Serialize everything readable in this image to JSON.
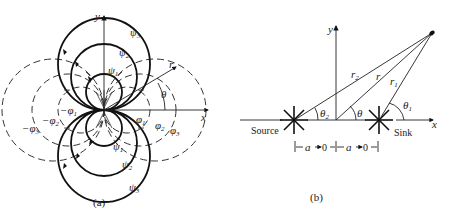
{
  "panel_a": {
    "caption": "(a)",
    "axis_x_label": "x",
    "axis_y_label": "y",
    "radial_label": "r",
    "angle_label": "θ",
    "streamlines": [
      {
        "symbol": "ψ",
        "index": "1"
      },
      {
        "symbol": "ψ",
        "index": "2"
      },
      {
        "symbol": "ψ",
        "index": "3"
      }
    ],
    "potential_lines_right": [
      {
        "symbol": "φ",
        "index": "1"
      },
      {
        "symbol": "φ",
        "index": "2"
      },
      {
        "symbol": "φ",
        "index": "3"
      }
    ],
    "potential_lines_left": [
      {
        "symbol": "−φ",
        "index": "1"
      },
      {
        "symbol": "−φ",
        "index": "2"
      },
      {
        "symbol": "−φ",
        "index": "3"
      }
    ]
  },
  "panel_b": {
    "caption": "(b)",
    "axis_x_label": "x",
    "axis_y_label": "y",
    "source_label": "Source",
    "sink_label": "Sink",
    "r_label": "r",
    "r1_label": {
      "symbol": "r",
      "index": "1"
    },
    "r2_label": {
      "symbol": "r",
      "index": "2"
    },
    "theta_label": "θ",
    "theta1_label": {
      "symbol": "θ",
      "index": "1"
    },
    "theta2_label": {
      "symbol": "θ",
      "index": "2"
    },
    "dimension_left": "a → 0",
    "dimension_right": "a → 0",
    "dim_a": "a",
    "dim_zero": "0"
  }
}
